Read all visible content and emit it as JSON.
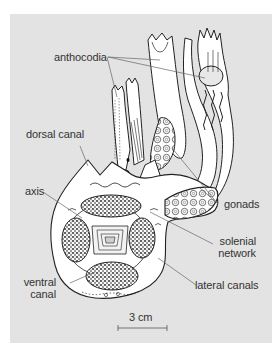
{
  "figure": {
    "labels": {
      "anthocodia": "anthocodia",
      "dorsal_canal": "dorsal canal",
      "axis": "axis",
      "gonads": "gonads",
      "solenial_line1": "solenial",
      "solenial_line2": "network",
      "ventral_line1": "ventral",
      "ventral_line2": "canal",
      "lateral_canals": "lateral canals"
    },
    "scale_bar": {
      "label": "3 cm"
    },
    "colors": {
      "panel_background": "#e3e3e3",
      "page_background": "#ffffff",
      "line_art": "#222222",
      "leader_lines": "#666666",
      "label_text": "#333333"
    }
  }
}
